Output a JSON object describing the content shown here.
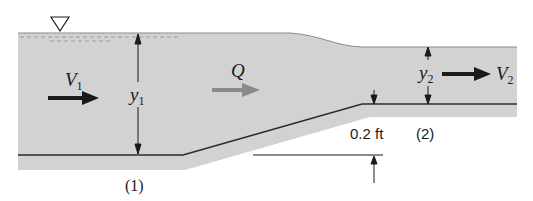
{
  "diagram": {
    "labels": {
      "v1": {
        "main": "V",
        "sub": "1"
      },
      "v2": {
        "main": "V",
        "sub": "2"
      },
      "y1": {
        "main": "y",
        "sub": "1"
      },
      "y2": {
        "main": "y",
        "sub": "2"
      },
      "q": "Q",
      "rise": "0.2 ft",
      "section1": "(1)",
      "section2": "(2)"
    },
    "symbols": {
      "free_surface": "inverted-triangle"
    },
    "colors": {
      "water": "#d2d2d2",
      "line": "#2b2b2b",
      "q_arrow": "#8a8a8a",
      "velocity_arrow": "#1a1a1a"
    }
  }
}
